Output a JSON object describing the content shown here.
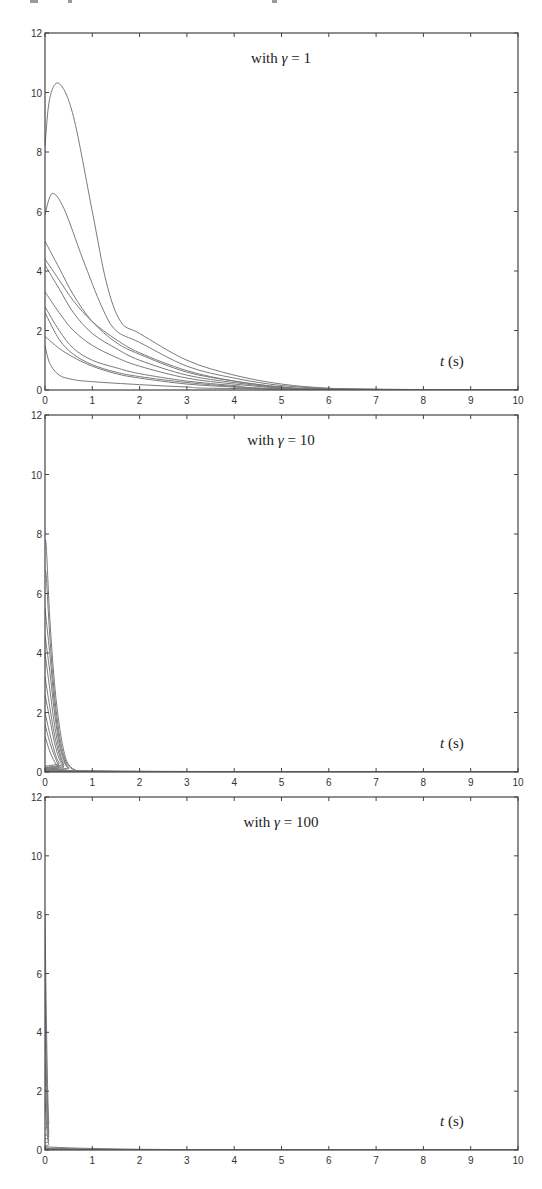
{
  "figure": {
    "panels": [
      {
        "annotation_prefix": "with ",
        "annotation_symbol": "γ",
        "annotation_suffix": " = 1",
        "xlabel_var": "t",
        "xlabel_unit": " (s)"
      },
      {
        "annotation_prefix": "with ",
        "annotation_symbol": "γ",
        "annotation_suffix": " = 10",
        "xlabel_var": "t",
        "xlabel_unit": " (s)"
      },
      {
        "annotation_prefix": "with ",
        "annotation_symbol": "γ",
        "annotation_suffix": " = 100",
        "xlabel_var": "t",
        "xlabel_unit": " (s)"
      }
    ]
  },
  "chart_data": [
    {
      "type": "line",
      "title": "with γ = 1",
      "xlabel": "t (s)",
      "ylabel": "",
      "xlim": [
        0,
        10
      ],
      "ylim": [
        0,
        12
      ],
      "xticks": [
        0,
        1,
        2,
        3,
        4,
        5,
        6,
        7,
        8,
        9,
        10
      ],
      "yticks": [
        0,
        2,
        4,
        6,
        8,
        10,
        12
      ],
      "grid": false,
      "legend": null,
      "series": [
        {
          "name": "trajectory 1",
          "x": [
            0,
            0.1,
            0.3,
            0.6,
            1.0,
            1.3,
            1.6,
            2,
            3,
            4,
            5,
            6,
            7,
            8,
            10
          ],
          "y": [
            8.2,
            9.8,
            10.3,
            9.2,
            6.0,
            3.6,
            2.3,
            1.9,
            1.0,
            0.5,
            0.2,
            0.06,
            0.02,
            0.0,
            0.0
          ]
        },
        {
          "name": "trajectory 2",
          "x": [
            0,
            0.15,
            0.4,
            0.8,
            1.2,
            1.5,
            2,
            3,
            4,
            5,
            6,
            7,
            10
          ],
          "y": [
            5.9,
            6.6,
            6.1,
            4.4,
            2.8,
            2.0,
            1.6,
            0.8,
            0.4,
            0.15,
            0.05,
            0.01,
            0.0
          ]
        },
        {
          "name": "trajectory 3",
          "x": [
            0,
            0.3,
            0.6,
            1.0,
            1.5,
            2,
            3,
            4,
            5,
            6,
            7,
            10
          ],
          "y": [
            5.0,
            4.1,
            3.2,
            2.3,
            1.6,
            1.2,
            0.6,
            0.3,
            0.1,
            0.03,
            0.01,
            0.0
          ]
        },
        {
          "name": "trajectory 4",
          "x": [
            0,
            0.3,
            0.6,
            1.0,
            1.5,
            2,
            3,
            4,
            5,
            6,
            10
          ],
          "y": [
            4.4,
            3.7,
            3.0,
            2.3,
            1.7,
            1.25,
            0.65,
            0.3,
            0.1,
            0.03,
            0.0
          ]
        },
        {
          "name": "trajectory 5",
          "x": [
            0,
            0.3,
            0.6,
            1.0,
            1.5,
            2,
            3,
            4,
            5,
            6,
            10
          ],
          "y": [
            4.2,
            3.4,
            2.6,
            1.9,
            1.4,
            1.0,
            0.5,
            0.25,
            0.08,
            0.02,
            0.0
          ]
        },
        {
          "name": "trajectory 6",
          "x": [
            0,
            0.3,
            0.6,
            1.0,
            1.5,
            2,
            3,
            4,
            5,
            6,
            10
          ],
          "y": [
            3.3,
            2.6,
            2.0,
            1.5,
            1.1,
            0.8,
            0.4,
            0.2,
            0.06,
            0.02,
            0.0
          ]
        },
        {
          "name": "trajectory 7",
          "x": [
            0,
            0.3,
            0.6,
            1.0,
            1.5,
            2,
            3,
            4,
            5,
            10
          ],
          "y": [
            2.8,
            2.0,
            1.4,
            1.0,
            0.75,
            0.55,
            0.3,
            0.15,
            0.05,
            0.0
          ]
        },
        {
          "name": "trajectory 8",
          "x": [
            0,
            0.3,
            0.6,
            1.0,
            1.5,
            2,
            3,
            4,
            5,
            10
          ],
          "y": [
            2.6,
            1.7,
            1.2,
            0.85,
            0.6,
            0.45,
            0.25,
            0.12,
            0.04,
            0.0
          ]
        },
        {
          "name": "trajectory 9",
          "x": [
            0,
            0.3,
            0.6,
            1.0,
            1.5,
            2,
            3,
            4,
            5,
            10
          ],
          "y": [
            1.8,
            1.4,
            1.1,
            0.8,
            0.55,
            0.4,
            0.2,
            0.1,
            0.03,
            0.0
          ]
        },
        {
          "name": "trajectory 10",
          "x": [
            0,
            0.1,
            0.3,
            0.6,
            1.0,
            2,
            3,
            4,
            10
          ],
          "y": [
            1.5,
            0.9,
            0.5,
            0.35,
            0.28,
            0.18,
            0.1,
            0.05,
            0.0
          ]
        }
      ]
    },
    {
      "type": "line",
      "title": "with γ = 10",
      "xlabel": "t (s)",
      "ylabel": "",
      "xlim": [
        0,
        10
      ],
      "ylim": [
        0,
        12
      ],
      "xticks": [
        0,
        1,
        2,
        3,
        4,
        5,
        6,
        7,
        8,
        9,
        10
      ],
      "yticks": [
        0,
        2,
        4,
        6,
        8,
        10,
        12
      ],
      "grid": false,
      "legend": null,
      "series": [
        {
          "name": "trajectory 1",
          "x": [
            0,
            0.03,
            0.1,
            0.2,
            0.3,
            0.4,
            0.5,
            0.7,
            1,
            10
          ],
          "y": [
            7.8,
            7.5,
            5.2,
            3.0,
            1.6,
            0.7,
            0.25,
            0.03,
            0.0,
            0.0
          ]
        },
        {
          "name": "trajectory 2",
          "x": [
            0,
            0.03,
            0.1,
            0.2,
            0.3,
            0.4,
            0.5,
            0.7,
            1,
            10
          ],
          "y": [
            6.8,
            6.5,
            4.6,
            2.6,
            1.3,
            0.55,
            0.2,
            0.02,
            0.0,
            0.0
          ]
        },
        {
          "name": "trajectory 3",
          "x": [
            0,
            0.1,
            0.2,
            0.3,
            0.4,
            0.5,
            0.7,
            10
          ],
          "y": [
            5.5,
            4.0,
            2.3,
            1.1,
            0.45,
            0.15,
            0.01,
            0.0
          ]
        },
        {
          "name": "trajectory 4",
          "x": [
            0,
            0.1,
            0.2,
            0.3,
            0.4,
            0.5,
            0.7,
            10
          ],
          "y": [
            4.6,
            3.4,
            2.0,
            0.95,
            0.38,
            0.12,
            0.01,
            0.0
          ]
        },
        {
          "name": "trajectory 5",
          "x": [
            0,
            0.1,
            0.2,
            0.3,
            0.4,
            0.6,
            10
          ],
          "y": [
            4.0,
            2.8,
            1.6,
            0.75,
            0.28,
            0.04,
            0.0
          ]
        },
        {
          "name": "trajectory 6",
          "x": [
            0,
            0.1,
            0.2,
            0.3,
            0.4,
            0.6,
            10
          ],
          "y": [
            3.2,
            2.2,
            1.25,
            0.6,
            0.22,
            0.03,
            0.0
          ]
        },
        {
          "name": "trajectory 7",
          "x": [
            0,
            0.1,
            0.2,
            0.3,
            0.4,
            0.6,
            10
          ],
          "y": [
            2.6,
            1.8,
            1.0,
            0.45,
            0.17,
            0.02,
            0.0
          ]
        },
        {
          "name": "trajectory 8",
          "x": [
            0,
            0.1,
            0.2,
            0.3,
            0.5,
            10
          ],
          "y": [
            2.0,
            1.3,
            0.7,
            0.3,
            0.05,
            0.0
          ]
        },
        {
          "name": "trajectory 9",
          "x": [
            0,
            0.1,
            0.2,
            0.3,
            0.5,
            10
          ],
          "y": [
            1.6,
            1.0,
            0.55,
            0.22,
            0.03,
            0.0
          ]
        },
        {
          "name": "trajectory 10",
          "x": [
            0,
            0.1,
            0.2,
            0.3,
            0.5,
            10
          ],
          "y": [
            1.2,
            0.7,
            0.35,
            0.15,
            0.02,
            0.0
          ]
        }
      ]
    },
    {
      "type": "line",
      "title": "with γ = 100",
      "xlabel": "t (s)",
      "ylabel": "",
      "xlim": [
        0,
        10
      ],
      "ylim": [
        0,
        12
      ],
      "xticks": [
        0,
        1,
        2,
        3,
        4,
        5,
        6,
        7,
        8,
        9,
        10
      ],
      "yticks": [
        0,
        2,
        4,
        6,
        8,
        10,
        12
      ],
      "grid": false,
      "legend": null,
      "series": [
        {
          "name": "trajectory 1",
          "x": [
            0,
            0.02,
            0.05,
            0.08,
            0.12,
            10
          ],
          "y": [
            8.0,
            5.5,
            2.5,
            0.9,
            0.1,
            0.0
          ]
        },
        {
          "name": "trajectory 2",
          "x": [
            0,
            0.02,
            0.05,
            0.08,
            0.12,
            10
          ],
          "y": [
            6.0,
            4.0,
            1.8,
            0.6,
            0.06,
            0.0
          ]
        },
        {
          "name": "trajectory 3",
          "x": [
            0,
            0.02,
            0.05,
            0.08,
            0.12,
            10
          ],
          "y": [
            4.5,
            3.0,
            1.3,
            0.45,
            0.05,
            0.0
          ]
        },
        {
          "name": "trajectory 4",
          "x": [
            0,
            0.02,
            0.05,
            0.08,
            0.12,
            10
          ],
          "y": [
            3.0,
            2.0,
            0.9,
            0.3,
            0.03,
            0.0
          ]
        },
        {
          "name": "trajectory 5",
          "x": [
            0,
            0.02,
            0.05,
            0.08,
            0.12,
            10
          ],
          "y": [
            1.8,
            1.2,
            0.5,
            0.18,
            0.02,
            0.0
          ]
        }
      ]
    }
  ]
}
